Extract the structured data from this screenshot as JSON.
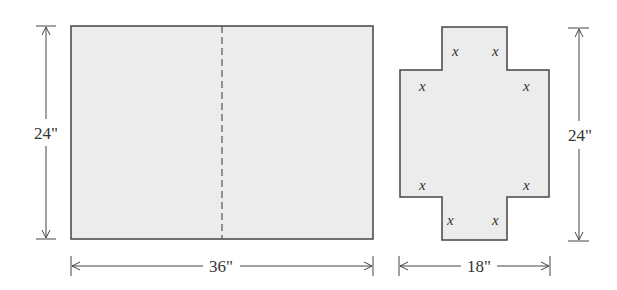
{
  "diagram": {
    "sheet": {
      "width_label": "36\"",
      "height_label": "24\"",
      "fold_line": "dashed center line"
    },
    "cutout": {
      "width_label": "18\"",
      "height_label": "24\"",
      "corner_labels": [
        "x",
        "x",
        "x",
        "x",
        "x",
        "x",
        "x",
        "x"
      ]
    },
    "colors": {
      "fill": "#ececec",
      "stroke": "#444444"
    }
  }
}
